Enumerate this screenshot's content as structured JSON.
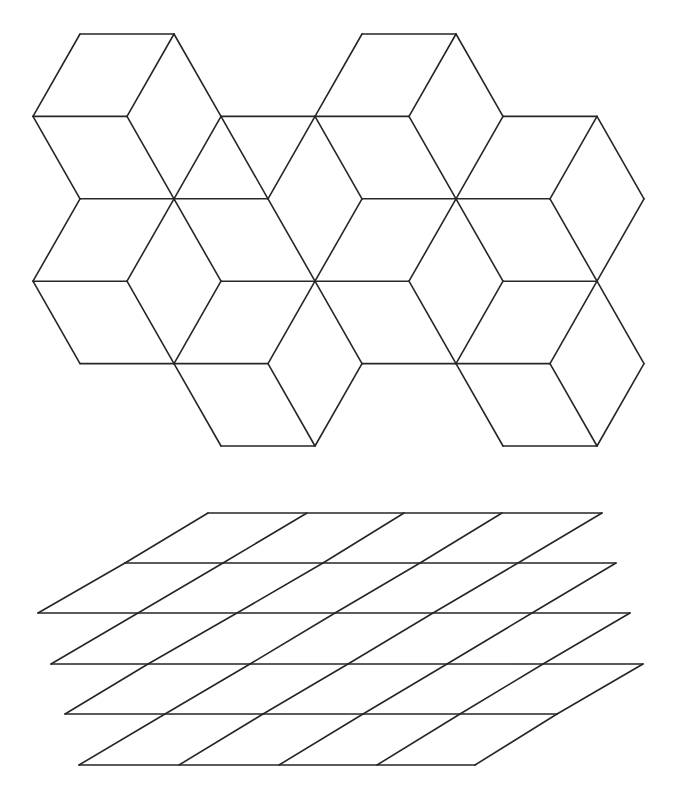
{
  "figure": {
    "width": 674,
    "height": 794,
    "stroke_color": "#262626",
    "background": "#ffffff",
    "panels": [
      {
        "name": "isometric-cube-tiling",
        "description": "Hexagonal cube tiling (tumbling blocks), lattice-based",
        "lattice": {
          "x0": 33,
          "dx": 47.0,
          "y0": 34,
          "dy": 82.4
        },
        "edges": [
          [
            [
              1,
              0
            ],
            [
              3,
              0
            ]
          ],
          [
            [
              7,
              0
            ],
            [
              9,
              0
            ]
          ],
          [
            [
              0,
              1
            ],
            [
              2,
              1
            ]
          ],
          [
            [
              4,
              1
            ],
            [
              6,
              1
            ]
          ],
          [
            [
              6,
              1
            ],
            [
              8,
              1
            ]
          ],
          [
            [
              10,
              1
            ],
            [
              12,
              1
            ]
          ],
          [
            [
              1,
              2
            ],
            [
              3,
              2
            ]
          ],
          [
            [
              3,
              2
            ],
            [
              5,
              2
            ]
          ],
          [
            [
              7,
              2
            ],
            [
              9,
              2
            ]
          ],
          [
            [
              9,
              2
            ],
            [
              11,
              2
            ]
          ],
          [
            [
              0,
              3
            ],
            [
              2,
              3
            ]
          ],
          [
            [
              4,
              3
            ],
            [
              6,
              3
            ]
          ],
          [
            [
              6,
              3
            ],
            [
              8,
              3
            ]
          ],
          [
            [
              10,
              3
            ],
            [
              12,
              3
            ]
          ],
          [
            [
              1,
              4
            ],
            [
              3,
              4
            ]
          ],
          [
            [
              3,
              4
            ],
            [
              5,
              4
            ]
          ],
          [
            [
              7,
              4
            ],
            [
              9,
              4
            ]
          ],
          [
            [
              9,
              4
            ],
            [
              11,
              4
            ]
          ],
          [
            [
              4,
              5
            ],
            [
              6,
              5
            ]
          ],
          [
            [
              10,
              5
            ],
            [
              12,
              5
            ]
          ],
          [
            [
              1,
              0
            ],
            [
              0,
              1
            ]
          ],
          [
            [
              3,
              0
            ],
            [
              2,
              1
            ]
          ],
          [
            [
              3,
              0
            ],
            [
              4,
              1
            ]
          ],
          [
            [
              0,
              1
            ],
            [
              1,
              2
            ]
          ],
          [
            [
              2,
              1
            ],
            [
              3,
              2
            ]
          ],
          [
            [
              4,
              1
            ],
            [
              3,
              2
            ]
          ],
          [
            [
              1,
              2
            ],
            [
              0,
              3
            ]
          ],
          [
            [
              3,
              2
            ],
            [
              2,
              3
            ]
          ],
          [
            [
              3,
              2
            ],
            [
              4,
              3
            ]
          ],
          [
            [
              0,
              3
            ],
            [
              1,
              4
            ]
          ],
          [
            [
              2,
              3
            ],
            [
              3,
              4
            ]
          ],
          [
            [
              4,
              3
            ],
            [
              3,
              4
            ]
          ],
          [
            [
              4,
              1
            ],
            [
              5,
              2
            ]
          ],
          [
            [
              6,
              1
            ],
            [
              5,
              2
            ]
          ],
          [
            [
              5,
              2
            ],
            [
              6,
              3
            ]
          ],
          [
            [
              7,
              2
            ],
            [
              6,
              3
            ]
          ],
          [
            [
              6,
              1
            ],
            [
              7,
              2
            ]
          ],
          [
            [
              7,
              0
            ],
            [
              6,
              1
            ]
          ],
          [
            [
              9,
              0
            ],
            [
              8,
              1
            ]
          ],
          [
            [
              9,
              0
            ],
            [
              10,
              1
            ]
          ],
          [
            [
              8,
              1
            ],
            [
              9,
              2
            ]
          ],
          [
            [
              10,
              1
            ],
            [
              9,
              2
            ]
          ],
          [
            [
              12,
              1
            ],
            [
              11,
              2
            ]
          ],
          [
            [
              12,
              1
            ],
            [
              13,
              2
            ]
          ],
          [
            [
              11,
              2
            ],
            [
              12,
              3
            ]
          ],
          [
            [
              13,
              2
            ],
            [
              12,
              3
            ]
          ],
          [
            [
              9,
              2
            ],
            [
              8,
              3
            ]
          ],
          [
            [
              9,
              2
            ],
            [
              10,
              3
            ]
          ],
          [
            [
              8,
              3
            ],
            [
              9,
              4
            ]
          ],
          [
            [
              10,
              3
            ],
            [
              9,
              4
            ]
          ],
          [
            [
              12,
              3
            ],
            [
              11,
              4
            ]
          ],
          [
            [
              12,
              3
            ],
            [
              13,
              4
            ]
          ],
          [
            [
              9,
              4
            ],
            [
              10,
              5
            ]
          ],
          [
            [
              11,
              4
            ],
            [
              12,
              5
            ]
          ],
          [
            [
              13,
              4
            ],
            [
              12,
              5
            ]
          ],
          [
            [
              6,
              3
            ],
            [
              5,
              4
            ]
          ],
          [
            [
              6,
              3
            ],
            [
              7,
              4
            ]
          ],
          [
            [
              5,
              4
            ],
            [
              6,
              5
            ]
          ],
          [
            [
              7,
              4
            ],
            [
              6,
              5
            ]
          ],
          [
            [
              3,
              4
            ],
            [
              4,
              5
            ]
          ]
        ]
      },
      {
        "name": "stacked-parallelogram-grid",
        "description": "Stacked sheared grid layers",
        "rows": [
          {
            "y": 513,
            "x": [
              208,
              307,
              404,
              502,
              602
            ]
          },
          {
            "y": 563,
            "x": [
              125,
              223,
              323,
              420,
              518,
              616
            ]
          },
          {
            "y": 613,
            "x": [
              38,
              138,
              237,
              335,
              433,
              532,
              630
            ]
          },
          {
            "y": 664,
            "x": [
              51,
              148,
              250,
              348,
              447,
              543,
              643
            ]
          },
          {
            "y": 714,
            "x": [
              65,
              165,
              263,
              363,
              460,
              557
            ]
          },
          {
            "y": 765,
            "x": [
              79,
              179,
              279,
              377,
              475
            ]
          }
        ],
        "slants": [
          {
            "from_row": 0,
            "to_row": 1,
            "pairs": [
              [
                0,
                0
              ],
              [
                1,
                1
              ],
              [
                2,
                2
              ],
              [
                3,
                3
              ],
              [
                4,
                4
              ]
            ]
          },
          {
            "from_row": 1,
            "to_row": 2,
            "pairs": [
              [
                0,
                0
              ],
              [
                1,
                1
              ],
              [
                2,
                2
              ],
              [
                3,
                3
              ],
              [
                4,
                4
              ],
              [
                5,
                5
              ]
            ]
          },
          {
            "from_row": 2,
            "to_row": 3,
            "pairs": [
              [
                1,
                0
              ],
              [
                2,
                1
              ],
              [
                3,
                2
              ],
              [
                4,
                3
              ],
              [
                5,
                4
              ],
              [
                6,
                5
              ]
            ]
          },
          {
            "from_row": 3,
            "to_row": 4,
            "pairs": [
              [
                1,
                0
              ],
              [
                2,
                1
              ],
              [
                3,
                2
              ],
              [
                4,
                3
              ],
              [
                5,
                4
              ],
              [
                6,
                5
              ]
            ]
          },
          {
            "from_row": 4,
            "to_row": 5,
            "pairs": [
              [
                1,
                0
              ],
              [
                2,
                1
              ],
              [
                3,
                2
              ],
              [
                4,
                3
              ],
              [
                5,
                4
              ]
            ]
          }
        ]
      }
    ]
  }
}
